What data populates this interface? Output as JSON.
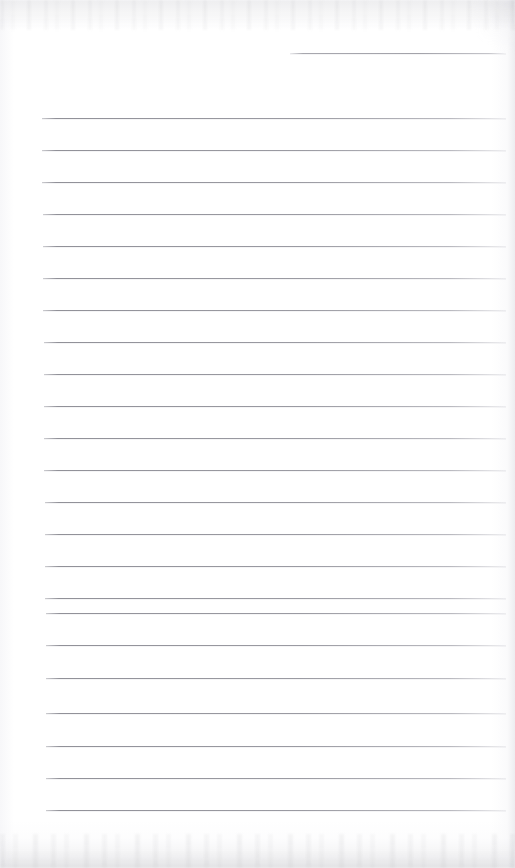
{
  "document": {
    "kind": "scanned-lined-notepad-page",
    "title": "Scanned Lined Notepad Page",
    "content_text": "",
    "handwriting_present": "no",
    "page_is_blank": "yes",
    "visible_text_items": [],
    "paper": {
      "background_color": "#ffffff",
      "tint_color": "#fafafb",
      "edge_shadow_color": "#ececef",
      "grain_color": "#96969b"
    },
    "rules": {
      "line_color": "#8b8b93",
      "line_thickness_px": 1,
      "count": 24,
      "spacing_px": 32,
      "left_margin_px": 44,
      "right_end_px": 505,
      "items": [
        {
          "id": "rule-0",
          "y": 53,
          "x": 290,
          "width": 216,
          "partial": true
        },
        {
          "id": "rule-1",
          "y": 118,
          "x": 42,
          "width": 464,
          "partial": false
        },
        {
          "id": "rule-2",
          "y": 150,
          "x": 42,
          "width": 464,
          "partial": false
        },
        {
          "id": "rule-3",
          "y": 182,
          "x": 42,
          "width": 464,
          "partial": false
        },
        {
          "id": "rule-4",
          "y": 214,
          "x": 43,
          "width": 463,
          "partial": false
        },
        {
          "id": "rule-5",
          "y": 246,
          "x": 43,
          "width": 463,
          "partial": false
        },
        {
          "id": "rule-6",
          "y": 278,
          "x": 43,
          "width": 463,
          "partial": false
        },
        {
          "id": "rule-7",
          "y": 310,
          "x": 43,
          "width": 463,
          "partial": false
        },
        {
          "id": "rule-8",
          "y": 342,
          "x": 44,
          "width": 462,
          "partial": false
        },
        {
          "id": "rule-9",
          "y": 374,
          "x": 44,
          "width": 462,
          "partial": false
        },
        {
          "id": "rule-10",
          "y": 406,
          "x": 44,
          "width": 462,
          "partial": false
        },
        {
          "id": "rule-11",
          "y": 438,
          "x": 44,
          "width": 462,
          "partial": false
        },
        {
          "id": "rule-12",
          "y": 470,
          "x": 44,
          "width": 462,
          "partial": false
        },
        {
          "id": "rule-13",
          "y": 502,
          "x": 45,
          "width": 461,
          "partial": false
        },
        {
          "id": "rule-14",
          "y": 534,
          "x": 45,
          "width": 461,
          "partial": false
        },
        {
          "id": "rule-15",
          "y": 566,
          "x": 45,
          "width": 461,
          "partial": false
        },
        {
          "id": "rule-16",
          "y": 598,
          "x": 45,
          "width": 461,
          "partial": false
        },
        {
          "id": "rule-17",
          "y": 613,
          "x": 46,
          "width": 460,
          "partial": false
        },
        {
          "id": "rule-18",
          "y": 645,
          "x": 46,
          "width": 460,
          "partial": false
        },
        {
          "id": "rule-19",
          "y": 678,
          "x": 46,
          "width": 460,
          "partial": false
        },
        {
          "id": "rule-20",
          "y": 713,
          "x": 46,
          "width": 460,
          "partial": false
        },
        {
          "id": "rule-21",
          "y": 746,
          "x": 46,
          "width": 460,
          "partial": false
        },
        {
          "id": "rule-22",
          "y": 778,
          "x": 46,
          "width": 460,
          "partial": false
        },
        {
          "id": "rule-23",
          "y": 810,
          "x": 46,
          "width": 460,
          "partial": false
        }
      ]
    }
  }
}
